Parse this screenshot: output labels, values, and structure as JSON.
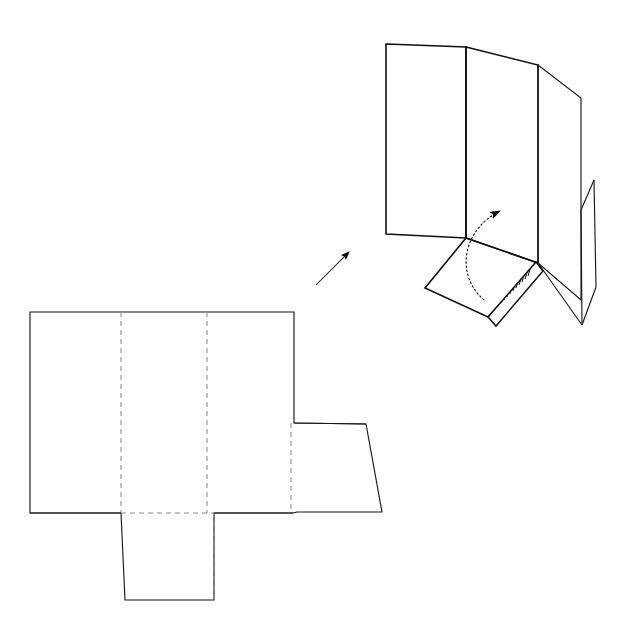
{
  "figure": {
    "background_color": "#ffffff",
    "line_color": "#1a1a1a",
    "fold_line_color": "#8c8c8c",
    "hatch_color": "#111111",
    "canvas": {
      "width": 632,
      "height": 629
    },
    "labels": [],
    "views": [
      {
        "id": "flat-blank",
        "name": "flat-die-cut-blank",
        "description": "Unfolded flat blank laid out with score lines",
        "position": "lower-left"
      },
      {
        "id": "folded-assembly",
        "name": "partially-folded-assembly",
        "description": "Three-dimensional partially erected carton with glue flap",
        "position": "upper-right"
      }
    ]
  },
  "flat_blank": {
    "name": "flat-blank-outline",
    "outline_points": "30,312 294,312 294,423 366,424 382,512 297,512 293,513 214,513 214,600 125,600 121,513 30,513",
    "main_body": {
      "name": "main-body-rectangle",
      "left": 30,
      "top": 312,
      "right": 294,
      "bottom": 513
    },
    "fold_lines": [
      {
        "name": "score-line-vertical-1",
        "x1": 121,
        "y1": 312,
        "x2": 121,
        "y2": 513,
        "style": "dashed"
      },
      {
        "name": "score-line-vertical-2",
        "x1": 207,
        "y1": 312,
        "x2": 207,
        "y2": 513,
        "style": "dashed"
      },
      {
        "name": "score-line-vertical-3",
        "x1": 291,
        "y1": 423,
        "x2": 291,
        "y2": 512,
        "style": "dashed"
      },
      {
        "name": "score-line-vertical-4",
        "x1": 214,
        "y1": 513,
        "x2": 214,
        "y2": 600,
        "style": "dashed"
      },
      {
        "name": "score-line-horizontal-bottom",
        "x1": 121,
        "y1": 513,
        "x2": 293,
        "y2": 513,
        "style": "dashed"
      },
      {
        "name": "score-line-horizontal-right-flap",
        "x1": 297,
        "y1": 512,
        "x2": 380,
        "y2": 512,
        "style": "dashed"
      }
    ],
    "flaps": [
      {
        "name": "right-side-flap",
        "shape_points": "291,423 366,424 382,512 297,512",
        "description": "Trapezoidal side flap with tapered outer edge"
      },
      {
        "name": "bottom-tuck-flap",
        "shape_points": "121,513 214,513 214,600 125,600",
        "description": "Tapered bottom closure tuck flap"
      }
    ],
    "panels": [
      {
        "name": "panel-left",
        "order": 1
      },
      {
        "name": "panel-center",
        "order": 2
      },
      {
        "name": "panel-right",
        "order": 3
      }
    ]
  },
  "folded_assembly": {
    "name": "folded-carton-assembly",
    "panels": [
      {
        "name": "panel-back-left",
        "shape_points": "386,44 466,47 466,238 386,234",
        "description": "Rear left upright panel"
      },
      {
        "name": "panel-front-center",
        "shape_points": "466,47 538,65 538,263 466,238",
        "description": "Center upright panel, foremost face"
      },
      {
        "name": "panel-right-wing",
        "shape_points": "538,65 581,98 581,300 538,263",
        "description": "Right upright panel angled outward"
      },
      {
        "name": "panel-bottom-open",
        "shape_points": "466,238 538,263 488,317 425,288",
        "description": "Bottom panel swung open, about to be folded up"
      }
    ],
    "edges": [
      {
        "name": "edge-bottom-right-fold",
        "x1": 538,
        "y1": 263,
        "x2": 581,
        "y2": 300
      },
      {
        "name": "edge-wing-lower",
        "x1": 538,
        "y1": 263,
        "x2": 582,
        "y2": 325
      },
      {
        "name": "edge-sliver-crease",
        "x1": 594,
        "y1": 180,
        "x2": 581,
        "y2": 210
      },
      {
        "name": "edge-sliver-right",
        "x1": 594,
        "y1": 180,
        "x2": 596,
        "y2": 287
      },
      {
        "name": "edge-sliver-point-left",
        "x1": 581,
        "y1": 210,
        "x2": 582,
        "y2": 325
      },
      {
        "name": "edge-sliver-point-right",
        "x1": 596,
        "y1": 287,
        "x2": 582,
        "y2": 325
      }
    ],
    "glue_flap": {
      "name": "hatched-glue-flap",
      "shape_points": "536,262 543,271 496,326 488,317",
      "hatch_pattern": "diagonal-parallel-lines",
      "hatch_line_count": 17,
      "description": "Adhesive glue strip shown with cross-hatching"
    },
    "motion_indicator": {
      "name": "fold-direction-arc",
      "type": "dotted-curved-arrow",
      "path": "M 484,300 C 455,275 462,230 500,211",
      "arrow_tip": {
        "x": 528,
        "y": 205
      },
      "description": "Dotted arc showing the bottom panel rotating upward into position"
    }
  },
  "transition_arrow": {
    "name": "assembly-direction-arrow",
    "type": "straight-arrow",
    "from": {
      "x": 316,
      "y": 285
    },
    "to": {
      "x": 346,
      "y": 248
    },
    "description": "Arrow pointing from the flat blank toward the folded assembly"
  }
}
